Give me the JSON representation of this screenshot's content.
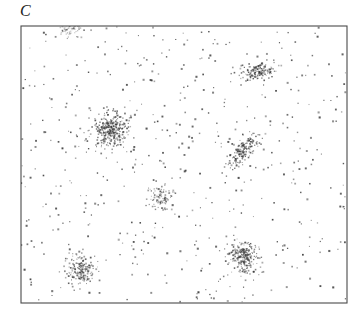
{
  "figure": {
    "panel_label": "C",
    "label_position": {
      "x": 20,
      "y": 1
    },
    "background_color": "#ffffff",
    "frame_color": "#4a4a4a",
    "point_color": "#2a2a2a",
    "cluster_point_color": "#3a3a3a"
  },
  "chart_data": {
    "type": "scatter",
    "title": "C",
    "subtitle": "",
    "xlabel": "",
    "ylabel": "",
    "grid": false,
    "legend": false,
    "legend_position": "none",
    "axis_ticks": false,
    "axis_tick_labels": [],
    "xlim": [
      21,
      347
    ],
    "ylim": [
      26,
      303
    ],
    "plot_frame": {
      "x": 21,
      "y": 26,
      "width": 326,
      "height": 277
    },
    "background_noise": {
      "name": "background",
      "n_points": 520,
      "distribution": "uniform",
      "point_size_px": 1.4,
      "color": "#2a2a2a",
      "opacity": 0.85
    },
    "clusters": [
      {
        "id": 1,
        "name": "top-edge-cluster",
        "center": [
          70,
          28
        ],
        "n_points": 70,
        "sigma_x": 6,
        "sigma_y": 5,
        "angle_deg": 0,
        "density": "low",
        "clipped_by_frame": true,
        "opacity": 0.5
      },
      {
        "id": 2,
        "name": "upper-right-vertical-cluster",
        "center": [
          258,
          71
        ],
        "n_points": 150,
        "sigma_x": 4,
        "sigma_y": 9,
        "angle_deg": 80,
        "density": "high",
        "clipped_by_frame": false,
        "opacity": 0.85
      },
      {
        "id": 3,
        "name": "left-large-dense-cluster",
        "center": [
          111,
          130
        ],
        "n_points": 330,
        "sigma_x": 9,
        "sigma_y": 8,
        "angle_deg": 0,
        "density": "very-high",
        "clipped_by_frame": false,
        "opacity": 0.85
      },
      {
        "id": 4,
        "name": "right-elongated-diagonal-cluster",
        "center": [
          243,
          150
        ],
        "n_points": 165,
        "sigma_x": 11,
        "sigma_y": 4,
        "angle_deg": -52,
        "density": "high",
        "clipped_by_frame": false,
        "opacity": 0.85
      },
      {
        "id": 5,
        "name": "center-small-sparse-cluster",
        "center": [
          161,
          198
        ],
        "n_points": 95,
        "sigma_x": 6,
        "sigma_y": 6,
        "angle_deg": 0,
        "density": "medium",
        "clipped_by_frame": false,
        "opacity": 0.75
      },
      {
        "id": 6,
        "name": "lower-right-round-cluster",
        "center": [
          244,
          257
        ],
        "n_points": 230,
        "sigma_x": 8,
        "sigma_y": 8,
        "angle_deg": 0,
        "density": "high",
        "clipped_by_frame": false,
        "opacity": 0.85
      },
      {
        "id": 7,
        "name": "lower-left-round-cluster",
        "center": [
          80,
          270
        ],
        "n_points": 175,
        "sigma_x": 7,
        "sigma_y": 7,
        "angle_deg": 0,
        "density": "high",
        "clipped_by_frame": false,
        "opacity": 0.8
      }
    ]
  }
}
